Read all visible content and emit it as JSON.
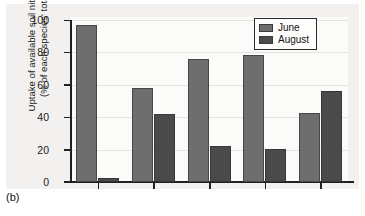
{
  "caption": "(b)",
  "colors": {
    "june": "#6e6e6e",
    "august": "#4a4a4a",
    "axis": "#231f20",
    "panel_background": "#f2f1ef",
    "plot_background": "#fbfbfa",
    "gridline": "#e4e3e0"
  },
  "legend": {
    "entries": [
      {
        "label": "June",
        "color": "#6e6e6e"
      },
      {
        "label": "August",
        "color": "#4a4a4a"
      }
    ]
  },
  "axis": {
    "y_title_line1": "Uptake of available soil nitrogen",
    "y_title_line2": "(% of each species' total)",
    "y_ticks": [
      "0",
      "20",
      "40",
      "60",
      "80",
      "100"
    ]
  },
  "chart_data": {
    "type": "bar",
    "title": "",
    "subtitle": "",
    "xlabel": "",
    "ylabel": "Uptake of available soil nitrogen (% of each species' total)",
    "ylim": [
      0,
      100
    ],
    "yticks": [
      0,
      20,
      40,
      60,
      80,
      100
    ],
    "grid": true,
    "legend_position": "top-right",
    "categories": [
      "1",
      "2",
      "3",
      "4",
      "5"
    ],
    "series": [
      {
        "name": "June",
        "color": "#6e6e6e",
        "values": [
          97,
          58,
          76,
          78.5,
          42.5
        ]
      },
      {
        "name": "August",
        "color": "#4a4a4a",
        "values": [
          2.5,
          42,
          22,
          20.5,
          56
        ]
      }
    ]
  }
}
